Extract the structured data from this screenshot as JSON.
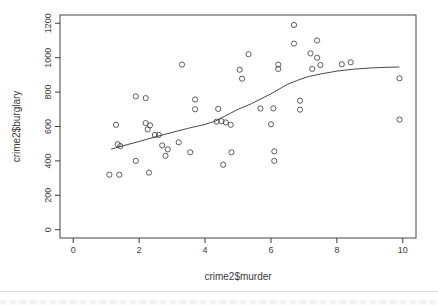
{
  "window": {
    "background": "#ffffff",
    "divider_color": "#dcdcdc"
  },
  "chart_data": {
    "type": "scatter",
    "title": "",
    "xlabel": "crime2$murder",
    "ylabel": "crime2$burglary",
    "x_ticks": [
      0,
      2,
      4,
      6,
      8,
      10
    ],
    "y_ticks": [
      0,
      200,
      400,
      600,
      800,
      1000,
      1200
    ],
    "xlim": [
      -0.4,
      10.4
    ],
    "ylim": [
      -48,
      1248
    ],
    "grid": false,
    "legend": null,
    "point_style": "open-circle",
    "point_color": "#4a4a4a",
    "line_color": "#333333",
    "axis_color": "#3a3a3a",
    "points": [
      [
        1.1,
        320
      ],
      [
        1.4,
        320
      ],
      [
        2.3,
        332
      ],
      [
        1.9,
        400
      ],
      [
        1.35,
        497
      ],
      [
        1.43,
        486
      ],
      [
        1.3,
        610
      ],
      [
        1.9,
        775
      ],
      [
        2.2,
        765
      ],
      [
        2.2,
        620
      ],
      [
        2.33,
        607
      ],
      [
        2.26,
        583
      ],
      [
        2.48,
        551
      ],
      [
        2.6,
        551
      ],
      [
        2.7,
        490
      ],
      [
        2.87,
        467
      ],
      [
        2.8,
        430
      ],
      [
        3.2,
        508
      ],
      [
        3.55,
        450
      ],
      [
        3.3,
        960
      ],
      [
        3.7,
        757
      ],
      [
        3.7,
        700
      ],
      [
        4.4,
        702
      ],
      [
        4.35,
        628
      ],
      [
        4.5,
        631
      ],
      [
        4.63,
        624
      ],
      [
        4.78,
        610
      ],
      [
        4.8,
        450
      ],
      [
        4.55,
        378
      ],
      [
        5.05,
        930
      ],
      [
        5.12,
        878
      ],
      [
        5.32,
        1020
      ],
      [
        5.68,
        705
      ],
      [
        6.07,
        705
      ],
      [
        6.0,
        613
      ],
      [
        6.1,
        455
      ],
      [
        6.1,
        400
      ],
      [
        6.22,
        960
      ],
      [
        6.22,
        935
      ],
      [
        6.7,
        1190
      ],
      [
        6.7,
        1082
      ],
      [
        6.88,
        750
      ],
      [
        6.88,
        698
      ],
      [
        7.2,
        1025
      ],
      [
        7.4,
        1100
      ],
      [
        7.4,
        1000
      ],
      [
        7.25,
        935
      ],
      [
        7.5,
        957
      ],
      [
        8.15,
        962
      ],
      [
        8.42,
        973
      ],
      [
        9.9,
        880
      ],
      [
        9.9,
        640
      ]
    ],
    "smooth_line": {
      "name": "lowess",
      "x": [
        1.15,
        1.5,
        2.0,
        2.5,
        3.0,
        3.5,
        4.0,
        4.3,
        4.6,
        5.0,
        5.4,
        6.0,
        6.5,
        6.8,
        7.1,
        7.5,
        8.0,
        8.5,
        9.0,
        9.5,
        9.9
      ],
      "y": [
        468,
        487,
        513,
        540,
        566,
        590,
        612,
        630,
        660,
        700,
        732,
        790,
        845,
        868,
        888,
        905,
        922,
        933,
        940,
        944,
        946
      ]
    }
  }
}
